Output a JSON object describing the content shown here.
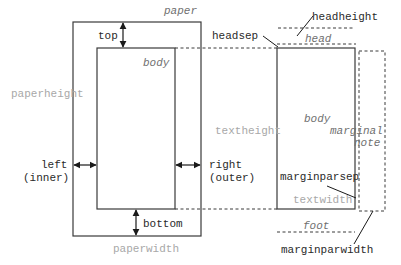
{
  "colors": {
    "line": "#3a3a3a",
    "dark_text": "#2a2a2a",
    "gray_text": "#a8a8a8",
    "italic_text": "#707070"
  },
  "labels": {
    "paper": "paper",
    "top": "top",
    "body_left": "body",
    "paperheight": "paperheight",
    "left": "left",
    "inner": "(inner)",
    "right": "right",
    "outer": "(outer)",
    "bottom": "bottom",
    "paperwidth": "paperwidth",
    "headheight": "headheight",
    "headsep": "headsep",
    "head": "head",
    "body_right": "body",
    "textheight": "textheight",
    "marginal": "marginal",
    "note": "note",
    "marginparsep": "marginparsep",
    "textwidth": "textwidth",
    "foot": "foot",
    "marginparwidth": "marginparwidth"
  }
}
